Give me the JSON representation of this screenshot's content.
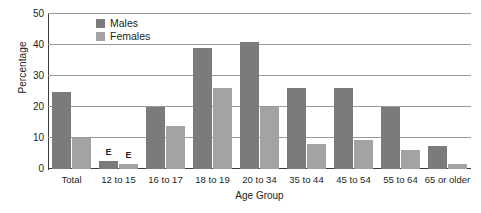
{
  "chart_data": {
    "type": "bar",
    "title": "",
    "xlabel": "Age Group",
    "ylabel": "Percentage",
    "ylim": [
      0,
      50
    ],
    "yticks": [
      0,
      10,
      20,
      30,
      40,
      50
    ],
    "grid": true,
    "legend_position": "top-left-inside",
    "categories": [
      "Total",
      "12 to 15",
      "16 to 17",
      "18 to 19",
      "20 to 34",
      "35 to 44",
      "45 to 54",
      "55 to 64",
      "65 or older"
    ],
    "series": [
      {
        "name": "Males",
        "color": "#7b7b7b",
        "values": [
          25,
          2.5,
          20,
          39,
          41,
          26,
          26,
          20,
          7.5
        ],
        "annotations": [
          "",
          "E",
          "",
          "",
          "",
          "",
          "",
          "",
          ""
        ]
      },
      {
        "name": "Females",
        "color": "#a3a3a3",
        "values": [
          10,
          1.5,
          14,
          26,
          20,
          8,
          9.5,
          6,
          1.5
        ],
        "annotations": [
          "",
          "E",
          "",
          "",
          "",
          "",
          "",
          "",
          ""
        ]
      }
    ]
  },
  "axis": {
    "y_title": "Percentage",
    "x_title": "Age Group",
    "y_tick_labels": [
      "50",
      "40",
      "30",
      "20",
      "10",
      "0"
    ]
  },
  "legend": {
    "items": [
      {
        "label": "Males",
        "color": "#7b7b7b"
      },
      {
        "label": "Females",
        "color": "#a3a3a3"
      }
    ]
  },
  "colors": {
    "males": "#7b7b7b",
    "females": "#a3a3a3",
    "gridline": "#9a9a9a",
    "axis": "#3a3a3a",
    "text": "#231f20",
    "background": "#ffffff"
  }
}
